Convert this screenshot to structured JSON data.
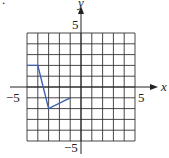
{
  "chart_data": {
    "type": "line",
    "title": "",
    "xlabel": "x",
    "ylabel": "y",
    "xlim": [
      -5,
      5
    ],
    "ylim": [
      -5,
      5
    ],
    "grid": true,
    "tick_labels": {
      "x_neg": "−5",
      "x_pos": "5",
      "y_pos": "5",
      "y_neg": "−5"
    },
    "series": [
      {
        "name": "piecewise-linear",
        "color": "#3a5fb0",
        "points": [
          [
            -5,
            2
          ],
          [
            -4,
            2
          ],
          [
            -3,
            -2
          ],
          [
            -1,
            -1
          ]
        ]
      }
    ]
  },
  "marker": "."
}
